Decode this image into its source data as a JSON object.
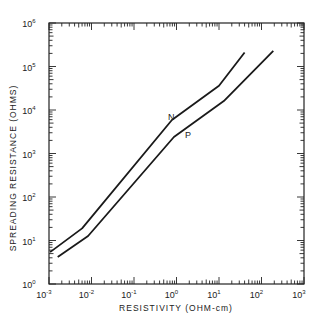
{
  "chart_data": {
    "type": "line",
    "title": "",
    "xlabel": "RESISTIVITY  (OHM-cm)",
    "ylabel": "SPREADING  RESISTANCE  (OHMS)",
    "xscale": "log",
    "yscale": "log",
    "xlim": [
      0.001,
      1000
    ],
    "ylim": [
      1,
      1000000
    ],
    "grid": false,
    "legend": "inline labels",
    "x_ticks": [
      "10^-3",
      "10^-2",
      "10^-1",
      "10^0",
      "10^1",
      "10^2",
      "10^3"
    ],
    "y_ticks": [
      "10^0",
      "10^1",
      "10^2",
      "10^3",
      "10^4",
      "10^5",
      "10^6"
    ],
    "series": [
      {
        "name": "N",
        "x": [
          0.00106,
          0.006,
          0.78,
          10,
          40
        ],
        "y": [
          5.4,
          19,
          5900,
          36000,
          210000
        ]
      },
      {
        "name": "P",
        "x": [
          0.0016,
          0.0083,
          0.87,
          13,
          190
        ],
        "y": [
          4.2,
          12.7,
          2400,
          16000,
          230000
        ]
      }
    ],
    "annotations": [
      {
        "text": "N",
        "x": 0.6,
        "y": 9000
      },
      {
        "text": "P",
        "x": 1.6,
        "y": 3800
      }
    ]
  },
  "axes": {
    "x_title": "RESISTIVITY  (OHM-cm)",
    "y_title": "SPREADING  RESISTANCE  (OHMS)",
    "x_tick_exps": [
      "-3",
      "-2",
      "-1",
      "0",
      "1",
      "2",
      "3"
    ],
    "y_tick_exps": [
      "0",
      "1",
      "2",
      "3",
      "4",
      "5",
      "6"
    ],
    "tick_base": "10"
  },
  "labels": {
    "n": "N",
    "p": "P"
  }
}
